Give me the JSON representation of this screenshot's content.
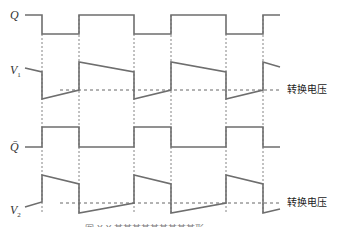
{
  "diagram": {
    "type": "timing-waveform",
    "signals": [
      {
        "id": "Q",
        "label": "Q",
        "subscript": ""
      },
      {
        "id": "V1",
        "label": "V",
        "subscript": "1"
      },
      {
        "id": "Qbar",
        "label": "Q̄",
        "subscript": ""
      },
      {
        "id": "V2",
        "label": "V",
        "subscript": "2"
      }
    ],
    "threshold_labels": {
      "v1": "转换电压",
      "v2": "转换电压"
    },
    "transition_x": [
      42,
      79,
      134,
      171,
      226,
      263
    ],
    "caption": "图 X-X  某某某某某某某某某形",
    "colors": {
      "waveform": "#6e6e6e",
      "dashed": "#666666",
      "text": "#333333"
    }
  }
}
